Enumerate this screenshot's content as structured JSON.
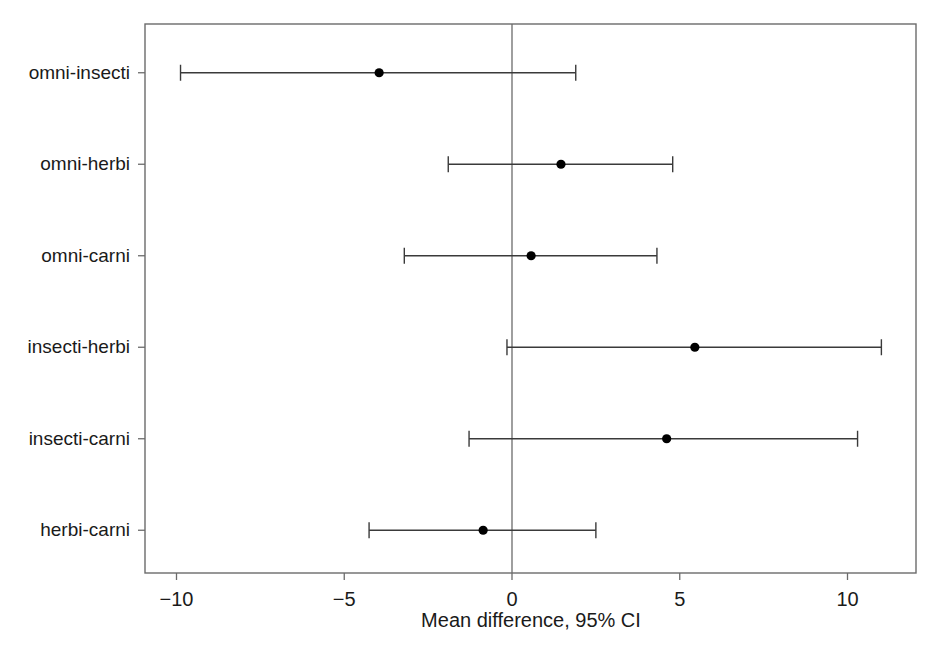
{
  "chart_data": {
    "type": "scatter",
    "subtype": "forest-plot-mean-difference-with-ci",
    "title": "",
    "xlabel": "Mean difference, 95% CI",
    "ylabel": "",
    "xlim": [
      -11.1,
      12.0
    ],
    "xticks": [
      -10,
      -5,
      0,
      5,
      10
    ],
    "xtick_labels": [
      "−10",
      "−5",
      "0",
      "5",
      "10"
    ],
    "grid": false,
    "legend": false,
    "reference_line": 0,
    "categories": [
      "omni-insecti",
      "omni-herbi",
      "omni-carni",
      "insecti-herbi",
      "insecti-carni",
      "herbi-carni"
    ],
    "series": [
      {
        "name": "Mean difference, 95% CI",
        "points": [
          {
            "category": "omni-insecti",
            "mean": -3.96,
            "ci_low": -9.88,
            "ci_high": 1.9
          },
          {
            "category": "omni-herbi",
            "mean": 1.46,
            "ci_low": -1.9,
            "ci_high": 4.79
          },
          {
            "category": "omni-carni",
            "mean": 0.57,
            "ci_low": -3.21,
            "ci_high": 4.32
          },
          {
            "category": "insecti-herbi",
            "mean": 5.45,
            "ci_low": -0.15,
            "ci_high": 11.01
          },
          {
            "category": "insecti-carni",
            "mean": 4.61,
            "ci_low": -1.28,
            "ci_high": 10.3
          },
          {
            "category": "herbi-carni",
            "mean": -0.86,
            "ci_low": -4.26,
            "ci_high": 2.5
          }
        ]
      }
    ],
    "colors": {
      "marker": "#000000",
      "whisker": "#3a3a3a",
      "frame": "#6b6b6b",
      "reference_line": "#6b6b6b",
      "background": "#ffffff",
      "text": "#1a1a1a"
    }
  },
  "axis": {
    "x_title": "Mean difference, 95% CI"
  }
}
